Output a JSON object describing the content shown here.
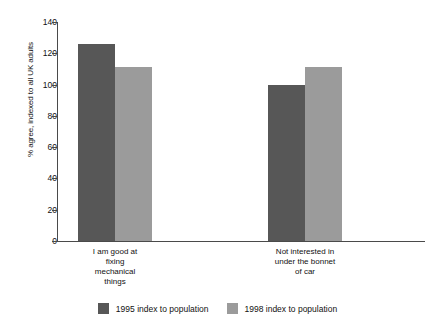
{
  "chart_data": {
    "type": "bar",
    "title": "",
    "subtitle": "",
    "xlabel": "",
    "ylabel": "% agree, indexed to all UK adults",
    "ylim": [
      0,
      140
    ],
    "yticks": [
      0,
      20,
      40,
      60,
      80,
      100,
      120,
      140
    ],
    "ytick_labels": [
      "0",
      "20",
      "40",
      "60",
      "80",
      "100",
      "120",
      "140"
    ],
    "grid": false,
    "legend_position": "bottom",
    "categories": [
      "I am good at fixing mechanical things",
      "Not interested in under the bonnet of car"
    ],
    "category_lines": [
      [
        "I am good at",
        "fixing",
        "mechanical",
        "things"
      ],
      [
        "Not interested in",
        "under the bonnet",
        "of car"
      ]
    ],
    "series": [
      {
        "name": "1995 index to population",
        "color": "#575757",
        "values": [
          126,
          100
        ]
      },
      {
        "name": "1998 index to population",
        "color": "#9b9b9b",
        "values": [
          111,
          111
        ]
      }
    ]
  },
  "legend": {
    "entries": [
      {
        "label": "1995 index to population",
        "swatch": "dark"
      },
      {
        "label": "1998 index to population",
        "swatch": "light"
      }
    ]
  },
  "axis": {
    "y_title": "% agree, indexed to all UK adults"
  }
}
